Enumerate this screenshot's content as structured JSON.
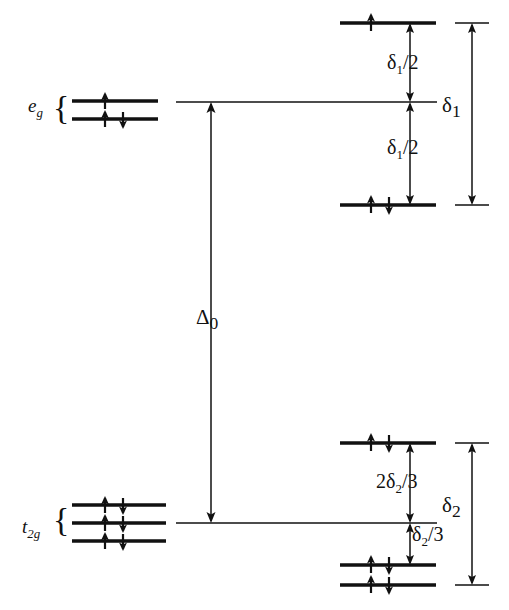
{
  "figure": {
    "type": "energy-level-diagram",
    "background_color": "#ffffff",
    "line_color": "#111111"
  },
  "left_groups": [
    {
      "id": "eg",
      "label_base": "e",
      "label_sub": "g",
      "brace": "{",
      "levels": [
        {
          "id": "eg-upper",
          "electrons": [
            "up"
          ]
        },
        {
          "id": "eg-lower",
          "electrons": [
            "up",
            "down"
          ]
        }
      ]
    },
    {
      "id": "t2g",
      "label_base": "t",
      "label_sub": "2g",
      "brace": "{",
      "levels": [
        {
          "id": "t2g-1",
          "electrons": [
            "up",
            "down"
          ]
        },
        {
          "id": "t2g-2",
          "electrons": [
            "up",
            "down"
          ]
        },
        {
          "id": "t2g-3",
          "electrons": [
            "up",
            "down"
          ]
        }
      ]
    }
  ],
  "right_levels": [
    {
      "id": "upper-split-top",
      "electrons": [
        "up"
      ]
    },
    {
      "id": "upper-split-bottom",
      "electrons": [
        "up",
        "down"
      ]
    },
    {
      "id": "lower-split-top",
      "electrons": [
        "up",
        "down"
      ]
    },
    {
      "id": "lower-split-mid",
      "electrons": [
        "up",
        "down"
      ]
    },
    {
      "id": "lower-split-bottom",
      "electrons": [
        "up",
        "down"
      ]
    }
  ],
  "labels": {
    "delta_o_base": "Δ",
    "delta_o_sub": "0",
    "delta1_half_top": {
      "base": "δ",
      "sub": "1",
      "suffix": "/2"
    },
    "delta1_half_bottom": {
      "base": "δ",
      "sub": "1",
      "suffix": "/2"
    },
    "two_delta2_thirds": {
      "prefix": "2",
      "base": "δ",
      "sub": "2",
      "suffix": "/3"
    },
    "delta2_third": {
      "base": "δ",
      "sub": "2",
      "suffix": "/3"
    },
    "delta1_total": {
      "base": "δ",
      "sub": "1"
    },
    "delta2_total": {
      "base": "δ",
      "sub": "2"
    }
  }
}
